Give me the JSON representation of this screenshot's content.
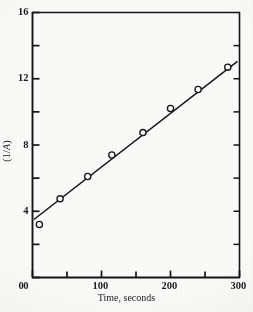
{
  "chart_data": {
    "type": "scatter",
    "title": "",
    "subtitle": "",
    "xlabel": "Time, seconds",
    "ylabel": "(1/A)",
    "xlim": [
      0,
      300
    ],
    "ylim": [
      0,
      16
    ],
    "grid": false,
    "legend": null,
    "x_major_ticks": [
      0,
      100,
      200,
      300
    ],
    "x_major_tick_labels": [
      "0",
      "100",
      "200",
      "300"
    ],
    "x_minor_ticks": [
      50,
      150,
      250
    ],
    "y_major_ticks": [
      0,
      4,
      8,
      12,
      16
    ],
    "y_major_tick_labels": [
      "0",
      "4",
      "8",
      "12",
      "16"
    ],
    "y_minor_ticks": [
      2,
      6,
      10,
      14
    ],
    "marker": "open-circle",
    "series": [
      {
        "name": "1/A vs time",
        "points": [
          {
            "x": 10,
            "y": 3.2
          },
          {
            "x": 40,
            "y": 4.75
          },
          {
            "x": 80,
            "y": 6.1
          },
          {
            "x": 115,
            "y": 7.4
          },
          {
            "x": 160,
            "y": 8.75
          },
          {
            "x": 200,
            "y": 10.2
          },
          {
            "x": 240,
            "y": 11.35
          },
          {
            "x": 283,
            "y": 12.7
          }
        ]
      }
    ],
    "fit_line": {
      "name": "linear fit",
      "x_start": 2,
      "y_start": 3.5,
      "x_end": 297,
      "y_end": 13.05
    }
  },
  "axes": {
    "x_tick_labels": [
      "0",
      "100",
      "200",
      "300"
    ],
    "y_tick_labels": [
      "0",
      "4",
      "8",
      "12",
      "16"
    ],
    "x_title": "Time, seconds",
    "y_title_prefix": "(1/",
    "y_title_italic": "A",
    "y_title_suffix": ")"
  },
  "style": {
    "ink_color": "#151515",
    "paper_color": "#fbfaf8"
  }
}
